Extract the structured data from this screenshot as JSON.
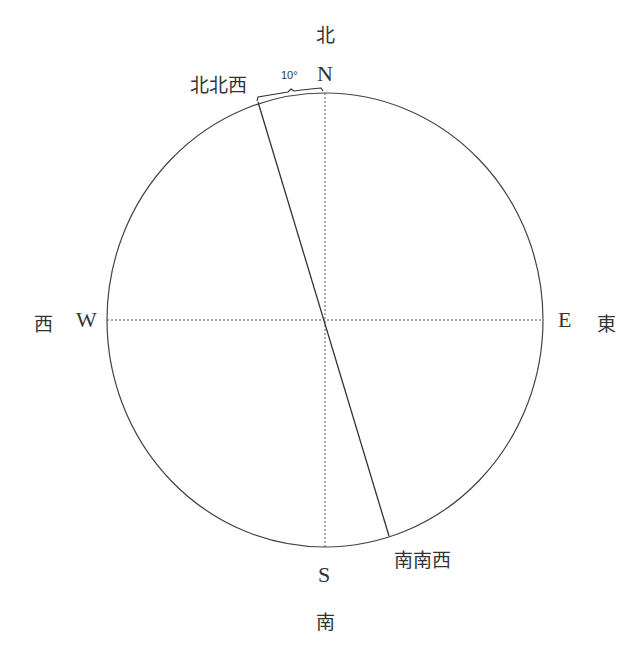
{
  "diagram": {
    "type": "compass",
    "cardinal_labels": {
      "north": {
        "latin": "N",
        "kanji": "北"
      },
      "south": {
        "latin": "S",
        "kanji": "南"
      },
      "east": {
        "latin": "E",
        "kanji": "東"
      },
      "west": {
        "latin": "W",
        "kanji": "西"
      }
    },
    "direction_line": {
      "start_label": "北北西",
      "end_label": "南南西"
    },
    "angle_label": "10°",
    "colors": {
      "stroke": "#444444",
      "text": "#333333",
      "background": "#ffffff"
    }
  }
}
